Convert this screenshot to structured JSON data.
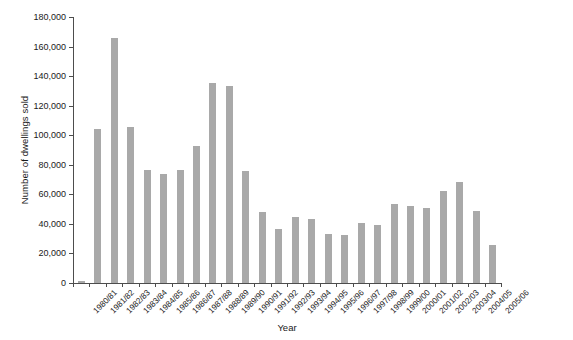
{
  "chart_data": {
    "type": "bar",
    "title": "",
    "xlabel": "Year",
    "ylabel": "Number of dwellings sold",
    "ylim": [
      0,
      180000
    ],
    "ytick_step": 20000,
    "ytick_labels": [
      "0",
      "20,000",
      "40,000",
      "60,000",
      "80,000",
      "100,000",
      "120,000",
      "140,000",
      "160,000",
      "180,000"
    ],
    "ytick_values": [
      0,
      20000,
      40000,
      60000,
      80000,
      100000,
      120000,
      140000,
      160000,
      180000
    ],
    "grid": false,
    "legend": "none",
    "bar_color": "#a9a9a9",
    "axis_color": "#4d4d4d",
    "categories": [
      "1980/81",
      "1981/82",
      "1982/83",
      "1983/84",
      "1984/85",
      "1985/86",
      "1986/87",
      "1987/88",
      "1988/89",
      "1989/90",
      "1990/91",
      "1991/92",
      "1992/93",
      "1993/94",
      "1994/95",
      "1995/96",
      "1996/97",
      "1997/98",
      "1998/99",
      "1999/00",
      "2000/01",
      "2001/02",
      "2002/03",
      "2003/04",
      "2004/05",
      "2005/06"
    ],
    "values": [
      1500,
      104000,
      166000,
      105500,
      76500,
      74000,
      76500,
      92500,
      135500,
      133500,
      75500,
      48000,
      36500,
      44500,
      43500,
      33000,
      32500,
      40500,
      39500,
      53500,
      52000,
      51000,
      62500,
      68500,
      48500,
      26000
    ]
  }
}
